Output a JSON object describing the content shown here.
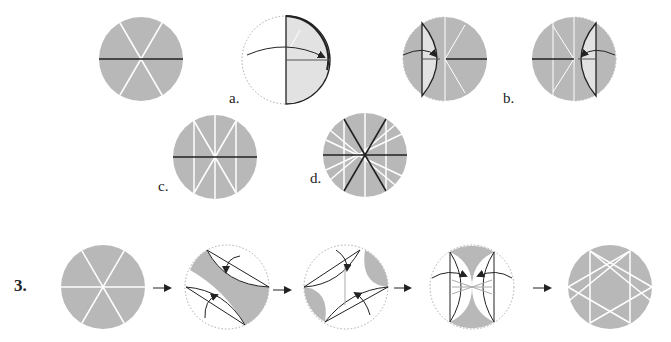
{
  "colors": {
    "paper": "#b8b8b8",
    "paper_light": "#e2e2e2",
    "crease": "#ffffff",
    "line": "#222222",
    "dotted": "#999999"
  },
  "labels": {
    "a": "a.",
    "b": "b.",
    "c": "c.",
    "d": "d."
  },
  "step": {
    "number": "3."
  },
  "figures": [
    {
      "id": "top-1",
      "desc": "circle with three crease diameters, horizontal valley"
    },
    {
      "id": "a",
      "desc": "fold left half to right"
    },
    {
      "id": "b-left",
      "desc": "fold left edge to center"
    },
    {
      "id": "b-right",
      "desc": "fold right edge to center"
    },
    {
      "id": "c",
      "desc": "creased circle with vertical creases"
    },
    {
      "id": "d",
      "desc": "star crease pattern"
    },
    {
      "id": "s3-1",
      "desc": "circle with six crease rays"
    },
    {
      "id": "s3-2",
      "desc": "fold two arcs diagonally"
    },
    {
      "id": "s3-3",
      "desc": "fold two arcs opposite diagonal"
    },
    {
      "id": "s3-4",
      "desc": "fold two arcs vertically"
    },
    {
      "id": "s3-5",
      "desc": "resulting star pattern"
    }
  ],
  "arrows": [
    "→",
    "→",
    "→",
    "→"
  ]
}
